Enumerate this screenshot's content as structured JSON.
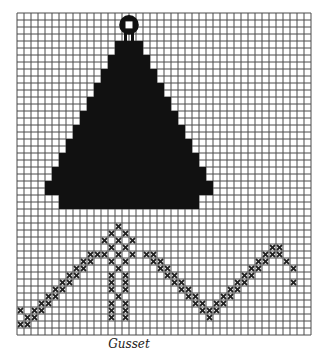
{
  "caption": "Gusset",
  "chart_data": {
    "type": "grid-pattern",
    "title": "Gusset",
    "grid": {
      "cols": 42,
      "rows": 46,
      "cell_px": 7,
      "origin": [
        17,
        13
      ],
      "line_color": "#4a4a4a",
      "fill_color": "#111111"
    },
    "ornament": {
      "center_col": 15.5,
      "center_row": 1.2,
      "radius_cells": 1.4
    },
    "stem": [
      [
        15,
        2
      ],
      [
        16,
        2
      ],
      [
        15,
        3
      ],
      [
        16,
        3
      ]
    ],
    "tree_blocks": [
      [
        14,
        4
      ],
      [
        16,
        4
      ],
      [
        13,
        6
      ],
      [
        15,
        6
      ],
      [
        17,
        6
      ],
      [
        12,
        8
      ],
      [
        14,
        8
      ],
      [
        16,
        8
      ],
      [
        18,
        8
      ],
      [
        11,
        10
      ],
      [
        13,
        10
      ],
      [
        15,
        10
      ],
      [
        17,
        10
      ],
      [
        19,
        10
      ],
      [
        10,
        12
      ],
      [
        12,
        12
      ],
      [
        14,
        12
      ],
      [
        16,
        12
      ],
      [
        18,
        12
      ],
      [
        20,
        12
      ],
      [
        9,
        14
      ],
      [
        11,
        14
      ],
      [
        13,
        14
      ],
      [
        15,
        14
      ],
      [
        17,
        14
      ],
      [
        19,
        14
      ],
      [
        21,
        14
      ],
      [
        8,
        16
      ],
      [
        10,
        16
      ],
      [
        12,
        16
      ],
      [
        14,
        16
      ],
      [
        16,
        16
      ],
      [
        18,
        16
      ],
      [
        20,
        16
      ],
      [
        22,
        16
      ],
      [
        7,
        18
      ],
      [
        9,
        18
      ],
      [
        11,
        18
      ],
      [
        13,
        18
      ],
      [
        15,
        18
      ],
      [
        17,
        18
      ],
      [
        19,
        18
      ],
      [
        21,
        18
      ],
      [
        23,
        18
      ],
      [
        6,
        20
      ],
      [
        8,
        20
      ],
      [
        10,
        20
      ],
      [
        12,
        20
      ],
      [
        14,
        20
      ],
      [
        16,
        20
      ],
      [
        18,
        20
      ],
      [
        20,
        20
      ],
      [
        22,
        20
      ],
      [
        24,
        20
      ],
      [
        5,
        22
      ],
      [
        7,
        22
      ],
      [
        9,
        22
      ],
      [
        11,
        22
      ],
      [
        13,
        22
      ],
      [
        15,
        22
      ],
      [
        17,
        22
      ],
      [
        19,
        22
      ],
      [
        21,
        22
      ],
      [
        23,
        22
      ],
      [
        25,
        22
      ],
      [
        4,
        24
      ],
      [
        6,
        24
      ],
      [
        8,
        24
      ],
      [
        10,
        24
      ],
      [
        12,
        24
      ],
      [
        14,
        24
      ],
      [
        16,
        24
      ],
      [
        18,
        24
      ],
      [
        20,
        24
      ],
      [
        22,
        24
      ],
      [
        24,
        24
      ],
      [
        26,
        24
      ],
      [
        6,
        26
      ],
      [
        8,
        26
      ],
      [
        10,
        26
      ],
      [
        12,
        26
      ],
      [
        14,
        26
      ],
      [
        16,
        26
      ],
      [
        18,
        26
      ],
      [
        20,
        26
      ],
      [
        22,
        26
      ],
      [
        24,
        26
      ]
    ],
    "cross_stitches": [
      [
        14,
        30
      ],
      [
        13,
        31
      ],
      [
        15,
        31
      ],
      [
        14,
        32
      ],
      [
        12,
        32
      ],
      [
        16,
        32
      ],
      [
        13,
        33
      ],
      [
        15,
        33
      ],
      [
        14,
        34
      ],
      [
        12,
        34
      ],
      [
        16,
        34
      ],
      [
        13,
        35
      ],
      [
        15,
        35
      ],
      [
        14,
        36
      ],
      [
        13,
        37
      ],
      [
        15,
        37
      ],
      [
        13,
        38
      ],
      [
        15,
        38
      ],
      [
        13,
        39
      ],
      [
        15,
        39
      ],
      [
        14,
        40
      ],
      [
        13,
        41
      ],
      [
        15,
        41
      ],
      [
        13,
        42
      ],
      [
        15,
        42
      ],
      [
        13,
        43
      ],
      [
        15,
        43
      ],
      [
        10,
        34
      ],
      [
        11,
        34
      ],
      [
        9,
        35
      ],
      [
        10,
        35
      ],
      [
        8,
        36
      ],
      [
        9,
        36
      ],
      [
        7,
        37
      ],
      [
        8,
        37
      ],
      [
        6,
        38
      ],
      [
        7,
        38
      ],
      [
        5,
        39
      ],
      [
        6,
        39
      ],
      [
        4,
        40
      ],
      [
        5,
        40
      ],
      [
        3,
        41
      ],
      [
        4,
        41
      ],
      [
        2,
        42
      ],
      [
        3,
        42
      ],
      [
        1,
        43
      ],
      [
        2,
        43
      ],
      [
        0,
        42
      ],
      [
        0,
        44
      ],
      [
        1,
        44
      ],
      [
        18,
        34
      ],
      [
        19,
        34
      ],
      [
        19,
        35
      ],
      [
        20,
        35
      ],
      [
        20,
        36
      ],
      [
        21,
        36
      ],
      [
        21,
        37
      ],
      [
        22,
        37
      ],
      [
        22,
        38
      ],
      [
        23,
        38
      ],
      [
        23,
        39
      ],
      [
        24,
        39
      ],
      [
        24,
        40
      ],
      [
        25,
        40
      ],
      [
        25,
        41
      ],
      [
        26,
        41
      ],
      [
        26,
        42
      ],
      [
        27,
        42
      ],
      [
        27,
        43
      ],
      [
        28,
        42
      ],
      [
        28,
        41
      ],
      [
        29,
        41
      ],
      [
        29,
        40
      ],
      [
        30,
        40
      ],
      [
        30,
        39
      ],
      [
        31,
        39
      ],
      [
        31,
        38
      ],
      [
        32,
        38
      ],
      [
        32,
        37
      ],
      [
        33,
        37
      ],
      [
        33,
        36
      ],
      [
        34,
        36
      ],
      [
        34,
        35
      ],
      [
        35,
        35
      ],
      [
        35,
        34
      ],
      [
        36,
        34
      ],
      [
        36,
        33
      ],
      [
        37,
        33
      ],
      [
        37,
        34
      ],
      [
        38,
        35
      ],
      [
        39,
        36
      ],
      [
        39,
        38
      ]
    ]
  }
}
